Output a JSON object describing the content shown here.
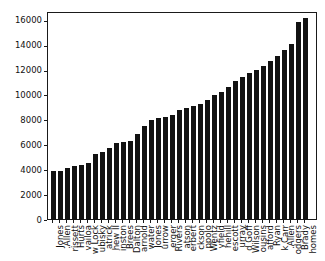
{
  "figure": {
    "background": "#ffffff",
    "bar_color": "#121212",
    "axis_color": "#1a1a1a",
    "text_color": "#111111"
  },
  "chart_data": {
    "type": "bar",
    "title": "",
    "xlabel": "",
    "ylabel": "",
    "grid": false,
    "legend": null,
    "ylim": [
      0,
      16700
    ],
    "yticks": [
      0,
      2000,
      4000,
      6000,
      8000,
      10000,
      12000,
      14000,
      16000
    ],
    "categories": [
      "Jones",
      ".Allen",
      "rissett",
      "Hurts",
      "vailoa",
      "w Lock",
      "ubisky",
      "atrick",
      "hew II",
      "inston",
      "Brees",
      "Dalton",
      "arnold",
      "water",
      "Jones",
      "urrow",
      "erger",
      "Rivers",
      "atson",
      "erbert",
      "ckson",
      "ppolo",
      "Wentz",
      "yfield",
      "nehill",
      "escott",
      "urray",
      "d Goff",
      "Wilson",
      "ousins",
      "afford",
      "Ryan",
      "k Carr",
      ".Allen",
      "odgers",
      "Brady",
      "homes"
    ],
    "values": [
      3950,
      3970,
      4150,
      4350,
      4380,
      4550,
      5280,
      5440,
      5810,
      6150,
      6250,
      6350,
      6880,
      7580,
      8050,
      8150,
      8250,
      8450,
      8850,
      9000,
      9150,
      9330,
      9650,
      10000,
      10250,
      10700,
      11150,
      11500,
      11800,
      12050,
      12400,
      12800,
      13200,
      13650,
      14150,
      15900,
      16250
    ]
  }
}
